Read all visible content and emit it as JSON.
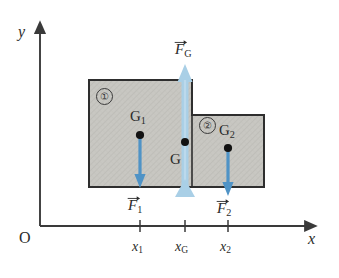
{
  "figure": {
    "type": "physics-diagram",
    "background_color": "#ffffff"
  },
  "axes": {
    "x_label": "x",
    "y_label": "y",
    "origin_label": "O",
    "color": "#3a3a3a",
    "origin_px": {
      "x": 40,
      "y": 226
    },
    "x_end_px": 312,
    "y_end_px": 26,
    "ticks": [
      {
        "id": "x1",
        "label": "x",
        "subscript": "1",
        "x_px": 140
      },
      {
        "id": "xG",
        "label": "x",
        "subscript": "G",
        "x_px": 185
      },
      {
        "id": "x2",
        "label": "x",
        "subscript": "2",
        "x_px": 228
      }
    ]
  },
  "body": {
    "fill_color": "#c8c7c2",
    "edge_color": "#2e2e2e",
    "parts": [
      {
        "id": "part1",
        "badge": "①",
        "badge_px": {
          "x": 96,
          "y": 88
        },
        "rect_px": {
          "x": 89,
          "y": 80,
          "w": 103,
          "h": 107
        }
      },
      {
        "id": "part2",
        "badge": "②",
        "badge_px": {
          "x": 199,
          "y": 117
        },
        "rect_px": {
          "x": 192,
          "y": 115,
          "w": 72,
          "h": 72
        }
      }
    ]
  },
  "points": [
    {
      "id": "G1",
      "label": "G",
      "subscript": "1",
      "label_px": {
        "x": 130,
        "y": 109
      },
      "dot_px": {
        "x": 140,
        "y": 135
      }
    },
    {
      "id": "G",
      "label": "G",
      "subscript": "",
      "label_px": {
        "x": 170,
        "y": 152
      },
      "dot_px": {
        "x": 185,
        "y": 142
      }
    },
    {
      "id": "G2",
      "label": "G",
      "subscript": "2",
      "label_px": {
        "x": 219,
        "y": 123
      },
      "dot_px": {
        "x": 228,
        "y": 148
      }
    }
  ],
  "forces": [
    {
      "id": "F1",
      "label": "F",
      "subscript": "1",
      "vector": true,
      "direction": "down",
      "color": "#4f93c6",
      "label_px": {
        "x": 128,
        "y": 198
      },
      "x_px": 140,
      "y_start_px": 135,
      "y_end_px": 186,
      "width_px": 3.2
    },
    {
      "id": "F2",
      "label": "F",
      "subscript": "2",
      "vector": true,
      "direction": "down",
      "color": "#4f93c6",
      "label_px": {
        "x": 217,
        "y": 201
      },
      "x_px": 228,
      "y_start_px": 148,
      "y_end_px": 195,
      "width_px": 3.2
    },
    {
      "id": "FG",
      "label": "F",
      "subscript": "G",
      "vector": true,
      "direction": "up",
      "color": "#a9cfe6",
      "label_px": {
        "x": 175,
        "y": 42
      },
      "x_px": 185,
      "y_start_px": 190,
      "y_end_px": 66,
      "width_px": 7
    }
  ],
  "pivot": {
    "id": "pivot-support",
    "shape": "triangle",
    "color": "#a9cfe6",
    "apex_px": {
      "x": 185,
      "y": 180
    },
    "base_y_px": 196,
    "half_width_px": 9
  }
}
